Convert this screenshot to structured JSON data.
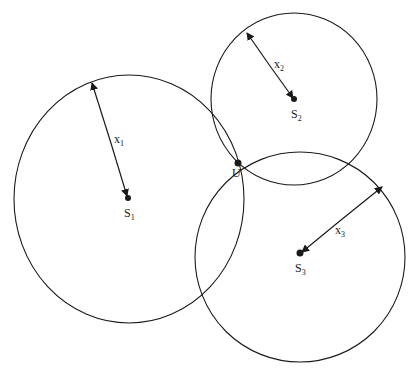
{
  "diagram": {
    "type": "trilateration",
    "circles": [
      {
        "id": "S1",
        "cx": 129,
        "cy": 199,
        "rx": 115,
        "ry": 124,
        "center_label": "S",
        "center_sub": "1",
        "radius_label": "x",
        "radius_sub": "1"
      },
      {
        "id": "S2",
        "cx": 294,
        "cy": 99,
        "rx": 83,
        "ry": 86,
        "center_label": "S",
        "center_sub": "2",
        "radius_label": "x",
        "radius_sub": "2"
      },
      {
        "id": "S3",
        "cx": 300,
        "cy": 257,
        "rx": 105,
        "ry": 105,
        "center_label": "S",
        "center_sub": "3",
        "radius_label": "x",
        "radius_sub": "3"
      }
    ],
    "intersection": {
      "label": "U",
      "x": 238,
      "y": 163
    },
    "stroke_color": "#1a1a1a"
  }
}
